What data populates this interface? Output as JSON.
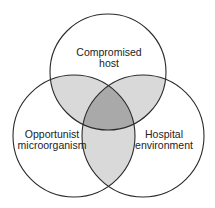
{
  "diagram": {
    "type": "venn",
    "sets": [
      {
        "id": "top",
        "label_lines": [
          "Compromised",
          "host"
        ]
      },
      {
        "id": "left",
        "label_lines": [
          "Opportunist",
          "microorganism"
        ]
      },
      {
        "id": "right",
        "label_lines": [
          "Hospital",
          "environment"
        ]
      }
    ],
    "colors": {
      "background": "#ffffff",
      "outline": "#2a2a2a",
      "pairwise_overlap": "#d9d9d9",
      "triple_overlap": "#a9a9a9",
      "text": "#222222"
    }
  }
}
